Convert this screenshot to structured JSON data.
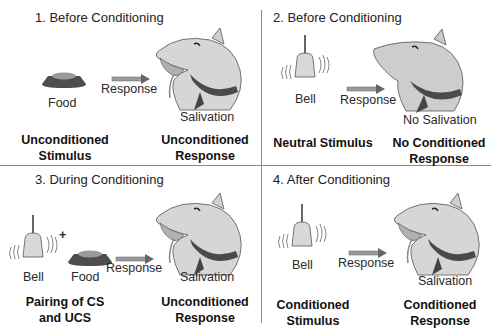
{
  "panels": [
    {
      "title": "1. Before Conditioning",
      "stimulus_labels": [
        "Food"
      ],
      "arrow_label": "Response",
      "response_label": "Salivation",
      "left_caption": [
        "Unconditioned",
        "Stimulus"
      ],
      "right_caption": [
        "Unconditioned",
        "Response"
      ],
      "dog_state": "salivating"
    },
    {
      "title": "2. Before Conditioning",
      "stimulus_labels": [
        "Bell"
      ],
      "arrow_label": "Response",
      "response_label": "No Salivation",
      "left_caption": [
        "Neutral Stimulus"
      ],
      "right_caption": [
        "No Conditioned",
        "Response"
      ],
      "dog_state": "not-salivating"
    },
    {
      "title": "3. During Conditioning",
      "stimulus_labels": [
        "Bell",
        "Food"
      ],
      "plus": "+",
      "arrow_label": "Response",
      "response_label": "Salivation",
      "left_caption": [
        "Pairing of CS",
        "and UCS"
      ],
      "right_caption": [
        "Unconditioned",
        "Response"
      ],
      "dog_state": "salivating"
    },
    {
      "title": "4. After Conditioning",
      "stimulus_labels": [
        "Bell"
      ],
      "arrow_label": "Response",
      "response_label": "Salivation",
      "left_caption": [
        "Conditioned",
        "Stimulus"
      ],
      "right_caption": [
        "Conditioned",
        "Response"
      ],
      "dog_state": "salivating"
    }
  ],
  "icons": {
    "food": "food-bowl-icon",
    "bell": "bell-icon",
    "arrow": "arrow-right-icon",
    "dog": "dog-head-icon"
  }
}
